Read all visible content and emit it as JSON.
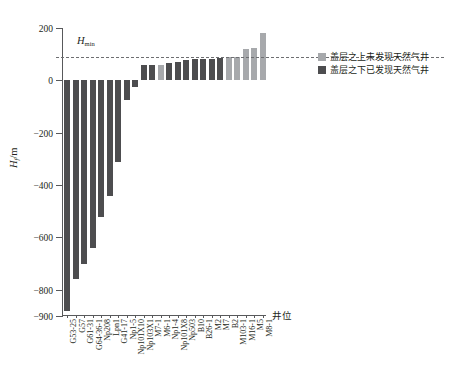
{
  "chart_data": {
    "type": "bar",
    "title": "",
    "xlabel": "井位",
    "ylabel": "H_f/m",
    "ylabel_main": "H",
    "ylabel_sub": "f",
    "ylabel_unit": "/m",
    "ylim": [
      -900,
      200
    ],
    "yticks": [
      200,
      0,
      -200,
      -400,
      -600,
      -800,
      -900
    ],
    "ytick_labels": [
      "200",
      "0",
      "−200",
      "−400",
      "−600",
      "−800",
      "−900"
    ],
    "grid": false,
    "legend_position": "right",
    "annotation": {
      "label_main": "H",
      "label_sub": "min",
      "value": 90
    },
    "categories": [
      "G53-25",
      "G57",
      "G61-31",
      "G64-36-1",
      "Np208",
      "Lpn1",
      "G41-17",
      "Np1-5",
      "Np101X10",
      "Np103X1",
      "M7-1",
      "M6-1",
      "Np1-4",
      "Np101X8",
      "Np503",
      "B10",
      "B26-1",
      "M2",
      "M7",
      "B2",
      "M103-1",
      "M16-1",
      "M5",
      "M8-1"
    ],
    "values": [
      -880,
      -760,
      -700,
      -640,
      -520,
      -440,
      -310,
      -75,
      -25,
      60,
      60,
      60,
      68,
      72,
      78,
      80,
      80,
      82,
      86,
      90,
      88,
      120,
      125,
      180
    ],
    "bar_types": [
      "dark",
      "dark",
      "dark",
      "dark",
      "dark",
      "dark",
      "dark",
      "dark",
      "dark",
      "dark",
      "dark",
      "light",
      "dark",
      "dark",
      "dark",
      "dark",
      "dark",
      "dark",
      "dark",
      "light",
      "light",
      "light",
      "light",
      "light"
    ],
    "colors": {
      "light": "#a7a9ac",
      "dark": "#4d4d4f",
      "axis": "#58595b",
      "dashed": "#6d6e71"
    },
    "legend": [
      {
        "key": "light",
        "label": "盖层之上未发现天然气井"
      },
      {
        "key": "dark",
        "label": "盖层之下已发现天然气井"
      }
    ]
  }
}
